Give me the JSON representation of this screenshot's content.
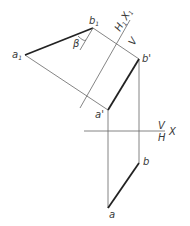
{
  "diagram": {
    "type": "descriptive-geometry-auxiliary-projection",
    "points": {
      "a1": {
        "label": "a",
        "sub": "1"
      },
      "b1": {
        "label": "b",
        "sub": "1"
      },
      "a_prime": {
        "label": "a'"
      },
      "b_prime": {
        "label": "b'"
      },
      "a": {
        "label": "a"
      },
      "b": {
        "label": "b"
      }
    },
    "angle_label": "β",
    "axis_x": {
      "label": "X",
      "upper": "V",
      "lower": "H"
    },
    "axis_x1": {
      "label_h": "H",
      "sub_h": "1",
      "label_x": "X",
      "sub_x": "1",
      "lower": "V"
    },
    "colors": {
      "line": "#555555",
      "bold": "#222222",
      "text": "#3a3a3a"
    }
  }
}
